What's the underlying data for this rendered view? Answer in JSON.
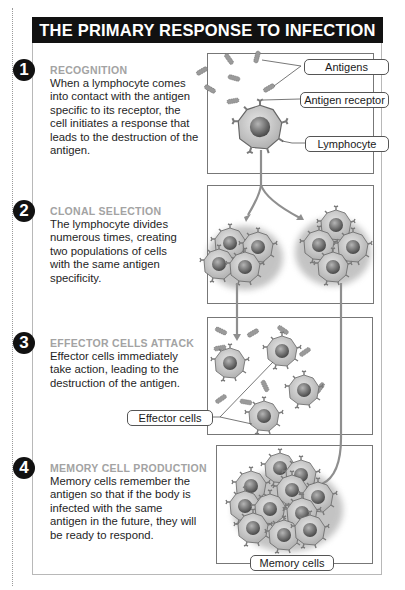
{
  "title": "THE PRIMARY RESPONSE TO INFECTION",
  "steps": [
    {
      "number": "1",
      "heading": "RECOGNITION",
      "body": "When a lymphocyte comes into contact with the antigen specific to its receptor, the cell initiates a response that leads to the destruction of the antigen."
    },
    {
      "number": "2",
      "heading": "CLONAL SELECTION",
      "body": "The lymphocyte divides numerous times, creating two populations of cells with the same antigen specificity."
    },
    {
      "number": "3",
      "heading": "EFFECTOR CELLS ATTACK",
      "body": "Effector cells immediately take action, leading to the destruction of the antigen."
    },
    {
      "number": "4",
      "heading": "MEMORY CELL PRODUCTION",
      "body": "Memory cells remember the antigen so that if the body is infected with the same antigen in the future, they will be ready to respond."
    }
  ],
  "labels": {
    "antigens": "Antigens",
    "antigen_receptor": "Antigen receptor",
    "lymphocyte": "Lymphocyte",
    "effector_cells": "Effector cells",
    "memory_cells": "Memory cells"
  },
  "colors": {
    "title_bg": "#111111",
    "heading_gray": "#a3a3a3",
    "cell_fill": "#c9c9c9",
    "nucleus": "#6f6f6f"
  }
}
